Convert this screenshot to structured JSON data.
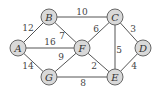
{
  "graph": {
    "nodes": [
      {
        "id": "A",
        "x": 18,
        "y": 48
      },
      {
        "id": "B",
        "x": 49,
        "y": 17
      },
      {
        "id": "C",
        "x": 115,
        "y": 17
      },
      {
        "id": "D",
        "x": 143,
        "y": 48
      },
      {
        "id": "E",
        "x": 115,
        "y": 77
      },
      {
        "id": "F",
        "x": 82,
        "y": 48
      },
      {
        "id": "G",
        "x": 49,
        "y": 77
      }
    ],
    "edges": [
      {
        "from": "A",
        "to": "B",
        "weight": "12",
        "lx": 28,
        "ly": 28
      },
      {
        "from": "B",
        "to": "C",
        "weight": "10",
        "lx": 82,
        "ly": 12
      },
      {
        "from": "A",
        "to": "F",
        "weight": "16",
        "lx": 50,
        "ly": 42
      },
      {
        "from": "B",
        "to": "F",
        "weight": "7",
        "lx": 62,
        "ly": 36
      },
      {
        "from": "A",
        "to": "G",
        "weight": "14",
        "lx": 28,
        "ly": 66
      },
      {
        "from": "C",
        "to": "F",
        "weight": "6",
        "lx": 96,
        "ly": 29
      },
      {
        "from": "C",
        "to": "D",
        "weight": "3",
        "lx": 133,
        "ly": 29
      },
      {
        "from": "C",
        "to": "E",
        "weight": "5",
        "lx": 119,
        "ly": 50
      },
      {
        "from": "F",
        "to": "G",
        "weight": "9",
        "lx": 61,
        "ly": 57
      },
      {
        "from": "F",
        "to": "E",
        "weight": "2",
        "lx": 94,
        "ly": 66
      },
      {
        "from": "D",
        "to": "E",
        "weight": "4",
        "lx": 134,
        "ly": 66
      },
      {
        "from": "G",
        "to": "E",
        "weight": "8",
        "lx": 83,
        "ly": 83
      }
    ]
  },
  "labels": {
    "A": "A",
    "B": "B",
    "C": "C",
    "D": "D",
    "E": "E",
    "F": "F",
    "G": "G"
  }
}
